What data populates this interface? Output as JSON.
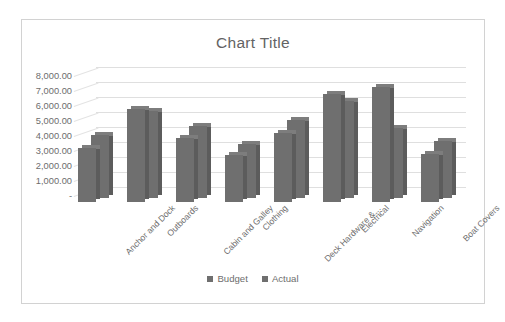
{
  "chart_data": {
    "type": "bar",
    "title": "Chart Title",
    "xlabel": "",
    "ylabel": "",
    "ylim": [
      0,
      8000
    ],
    "grid": true,
    "legend_position": "bottom",
    "style": "3d-clustered-column",
    "categories": [
      "Anchor and Dock",
      "Outboards",
      "Cabin and Galley",
      "Clothing",
      "Deck Hardware &…",
      "Electrical",
      "Navigation",
      "Boat Covers"
    ],
    "ytick_labels": [
      "8,000.00",
      "7,000.00",
      "6,000.00",
      "5,000.00",
      "4,000.00",
      "3,000.00",
      "2,000.00",
      "1,000.00",
      "-"
    ],
    "ytick_values": [
      8000,
      7000,
      6000,
      5000,
      4000,
      3000,
      2000,
      1000,
      0
    ],
    "series": [
      {
        "name": "Budget",
        "color": "#6f6f6f",
        "values": [
          3600,
          6200,
          4300,
          3150,
          4600,
          7200,
          7700,
          3200
        ]
      },
      {
        "name": "Actual",
        "color": "#6f6f6f",
        "values": [
          4200,
          5800,
          4800,
          3600,
          5200,
          6500,
          4700,
          3800
        ]
      }
    ]
  },
  "colors": {
    "bar_face": "#6f6f6f",
    "bar_side": "#5c5c5c",
    "bar_top": "#7d7d7d",
    "gridline": "#dfdfdf",
    "text": "#6d6d6d",
    "border": "#d2d2d2",
    "background": "#ffffff"
  }
}
